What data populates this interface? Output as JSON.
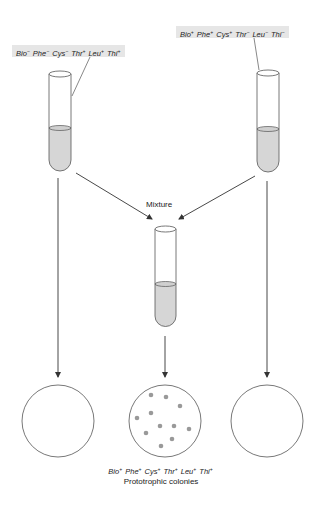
{
  "strains": {
    "left": {
      "genotype": [
        {
          "gene": "Bio",
          "sign": "−"
        },
        {
          "gene": "Phe",
          "sign": "−"
        },
        {
          "gene": "Cys",
          "sign": "−"
        },
        {
          "gene": "Thr",
          "sign": "+"
        },
        {
          "gene": "Leu",
          "sign": "+"
        },
        {
          "gene": "Thi",
          "sign": "+"
        }
      ]
    },
    "right": {
      "genotype": [
        {
          "gene": "Bio",
          "sign": "+"
        },
        {
          "gene": "Phe",
          "sign": "+"
        },
        {
          "gene": "Cys",
          "sign": "+"
        },
        {
          "gene": "Thr",
          "sign": "−"
        },
        {
          "gene": "Leu",
          "sign": "−"
        },
        {
          "gene": "Thi",
          "sign": "−"
        }
      ]
    }
  },
  "mixture_label": "Mixture",
  "result": {
    "genotype": [
      {
        "gene": "Bio",
        "sign": "+"
      },
      {
        "gene": "Phe",
        "sign": "+"
      },
      {
        "gene": "Cys",
        "sign": "+"
      },
      {
        "gene": "Thr",
        "sign": "+"
      },
      {
        "gene": "Leu",
        "sign": "+"
      },
      {
        "gene": "Thi",
        "sign": "+"
      }
    ],
    "caption": "Prototrophic colonies"
  },
  "plates": [
    {
      "id": "left",
      "colonies": 0
    },
    {
      "id": "middle",
      "colonies": 12
    },
    {
      "id": "right",
      "colonies": 0
    }
  ],
  "colors": {
    "liquid": "#d6d6d6",
    "line": "#444444",
    "colony": "#999999",
    "label_bg": "#e6e6e6"
  }
}
